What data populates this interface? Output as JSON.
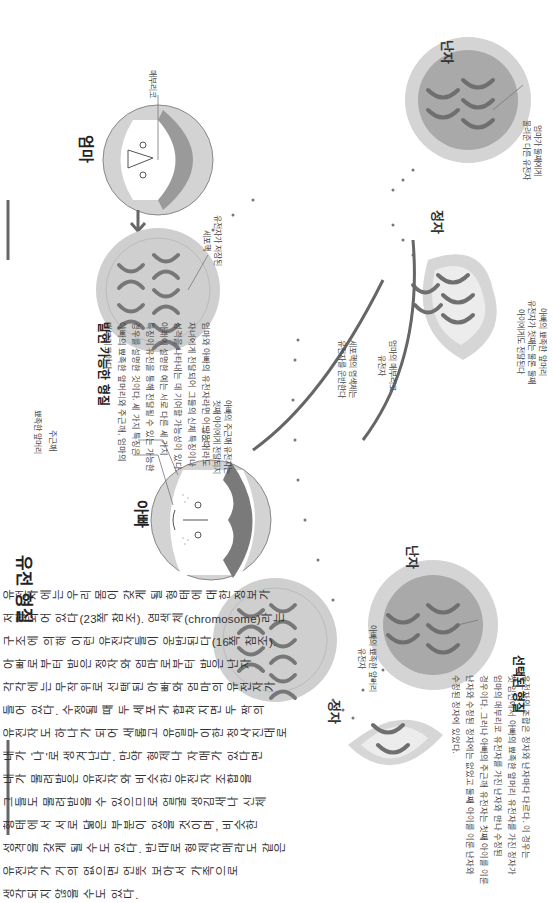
{
  "main": {
    "title": "유전 형질",
    "lines": [
      "유전자에는 우리 몸이 갖게 될 형태에 대한 정보가",
      "저장되어 있다(23쪽 참조). 염색체(chromosome)라는",
      "구조에 의해 이런 유전자들이 운반된다(16쪽 참조).",
      "아빠로부터 받은 정자와 엄마로부터 받은 난자",
      "각각에는 무작위로 선택된 아빠와 엄마의 유전자가",
      "들어 있다. 수정될 때 두 세포가 합쳐지면 두 짝의",
      "유전자도 하나가 되어 새롭고 유일무이한 청사진대로",
      "내가 '나'로 생겨난다. 만약 형제나 자매가 있다면",
      "내가 물려받은 유전자와 비슷한 유전자 조합을",
      "그들도 물려받을 수 있으므로 얼굴 생김새나 신체",
      "형태에서 서로 닮은 부분이 있을 것이며, 비슷한",
      "성격을 갖게 될 수도 있다. 반대로 형제자매라도 같은",
      "유전자가 거의 없으면 언뜻 보아서 가족으로",
      "생각되지 않을 수도 있다."
    ]
  },
  "possible_traits": {
    "title": "발현 가능한 형질",
    "lines": [
      "엄마와 아빠의 유전자라면 어느 것이라도",
      "자녀에게 전달되어 그들의 신체 특징이나",
      "성격을 나타내는 데 기여할 가능성이 있다.",
      "아래에 설명한 예는 서로 다른 세 가지",
      "특징이 유전을 통해 전달될 수 있는 가능한",
      "경우를 설명한 것이다. 세 가지 특징은",
      "아빠의 뾰족한 앞머리와 주근깨, 엄마의",
      "매부리코이다."
    ]
  },
  "selected_traits": {
    "title": "선택된 형질",
    "lines": [
      "유전자의 조합은 정자와 난자마다 다르다. 이 경우는",
      "첫 임신에서 아빠의 뾰족한 앞머리 유전자를 가진 정자가",
      "엄마의 매부리코 유전자를 가진 난자와 만나 수정된",
      "경우이다. 그러나 아빠의 주근깨 유전자는 첫째 아이를 이룬",
      "난자와 수정된 정자에는 없었고 둘째 아이를 이룬 난자와",
      "수정된 정자에 있었다."
    ]
  },
  "people": {
    "dad": {
      "label": "아빠",
      "callouts": [
        "뾰족한 앞머리",
        "주근깨"
      ]
    },
    "mom": {
      "label": "엄마",
      "callouts": [
        "매부리코"
      ]
    }
  },
  "gametes": {
    "sperm_1": "정자",
    "egg_1": "난자",
    "sperm_2": "정자",
    "egg_2": "난자"
  },
  "callouts": {
    "nucleus": [
      "유전자가 저장된",
      "세포핵"
    ],
    "dad_freckle_not_passed": [
      "아빠의 주근깨 유전자는",
      "첫째 아이에게 전달되지",
      "않는다"
    ],
    "chromosomes_carry": [
      "세포핵의 염색체는",
      "유전자를 운반한다"
    ],
    "dad_pointed_hairline_gene": [
      "아빠의 뾰족한 앞머리",
      "유전자"
    ],
    "mom_hooked_nose_gene": [
      "엄마의 매부리코",
      "유전자"
    ],
    "dad_hairline_both_children": [
      "아빠의 뾰족한 앞머리",
      "유전자가 첫째는 물론 둘째",
      "아이에게도 전달된다"
    ],
    "mom_other_gene_second": [
      "엄마가 둘째에게",
      "물려준 다른 유전자"
    ]
  },
  "colors": {
    "cell_outer": "#cfcfcf",
    "cell_inner": "#b5b5b5",
    "egg_outer": "#d4d4d4",
    "egg_inner": "#a9a9a9",
    "sperm_outer": "#d6d6d6",
    "sperm_inner": "#ececec",
    "arrow": "#666666",
    "dot": "#777777",
    "text": "#333333"
  }
}
